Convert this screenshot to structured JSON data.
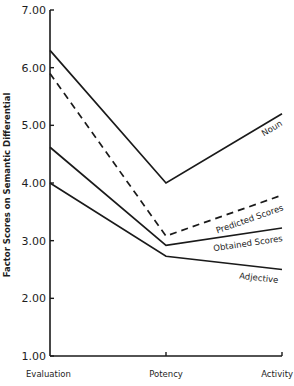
{
  "chart_data": {
    "type": "line",
    "title": "",
    "xlabel": "",
    "ylabel": "Factor Scores on Semantic Differential",
    "categories": [
      "Evaluation",
      "Potency",
      "Activity"
    ],
    "ylim": [
      1.0,
      7.0
    ],
    "yticks": [
      "1.00",
      "2.00",
      "3.00",
      "4.00",
      "5.00",
      "6.00",
      "7.00"
    ],
    "grid": false,
    "legend": "inline labels at right end of lines",
    "series": [
      {
        "name": "Noun",
        "values": [
          6.3,
          4.0,
          5.2
        ],
        "style": "solid"
      },
      {
        "name": "Predicted Scores",
        "values": [
          5.9,
          3.08,
          3.79
        ],
        "style": "dashed"
      },
      {
        "name": "Obtained Scores",
        "values": [
          4.62,
          2.92,
          3.22
        ],
        "style": "solid"
      },
      {
        "name": "Adjective",
        "values": [
          4.0,
          2.73,
          2.5
        ],
        "style": "solid"
      }
    ],
    "colors": {
      "line": "#1a1a1a",
      "background": "#ffffff"
    }
  }
}
